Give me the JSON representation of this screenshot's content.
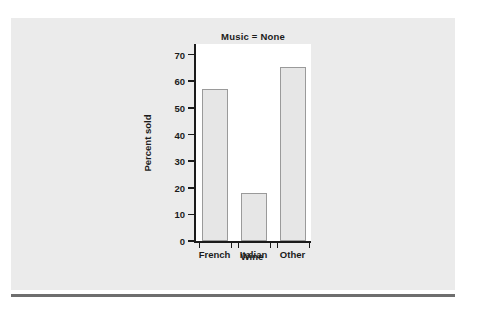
{
  "figure": {
    "panel_color": "#ebebeb",
    "plot_background": "#ffffff",
    "rule_color": "#6e6e6e"
  },
  "chart_data": {
    "type": "bar",
    "title": "Music = None",
    "xlabel": "Wine",
    "ylabel": "Percent sold",
    "categories": [
      "French",
      "Italian",
      "Other"
    ],
    "values": [
      57,
      18,
      65.5
    ],
    "ylim": [
      0,
      74
    ],
    "yticks": [
      0,
      10,
      20,
      30,
      40,
      50,
      60,
      70
    ],
    "ytick_labels": [
      "0",
      "10",
      "20",
      "30",
      "40",
      "50",
      "60",
      "70"
    ],
    "grid": false,
    "legend": false,
    "bar_fill": "#e6e6e6",
    "bar_edge": "#9a9a9a"
  }
}
